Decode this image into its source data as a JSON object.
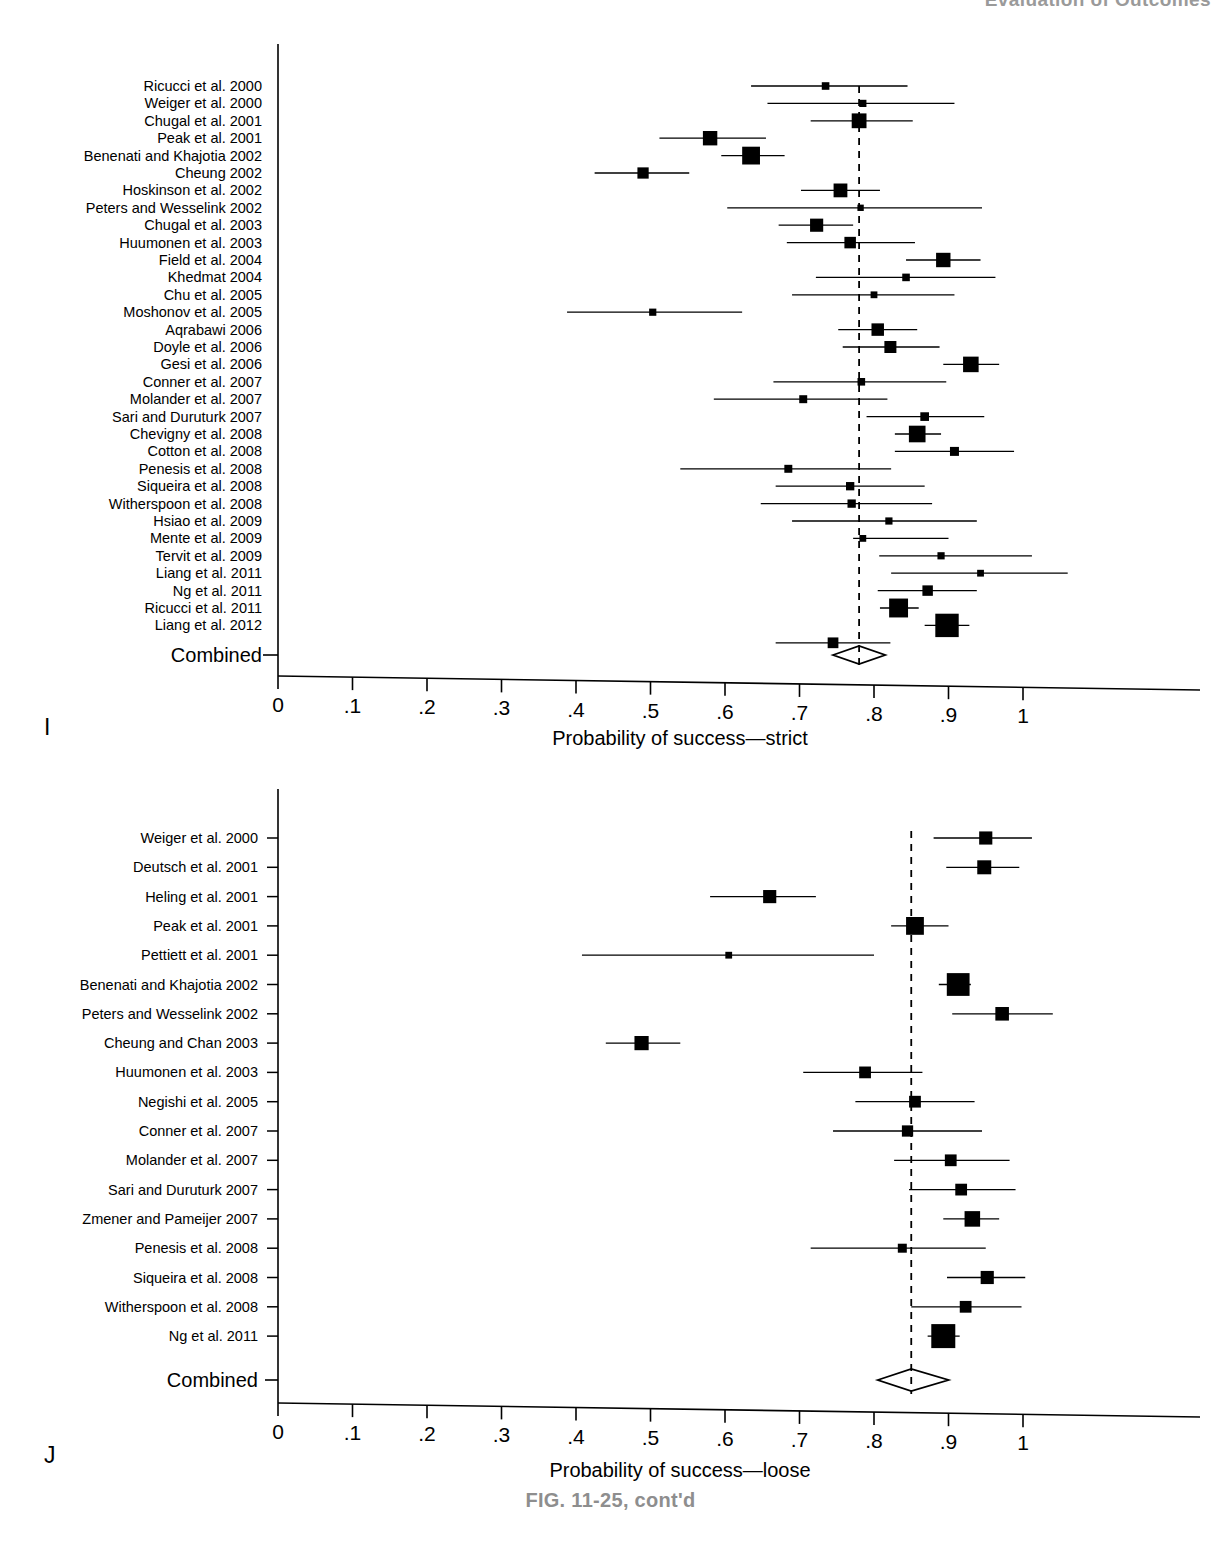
{
  "running_header": "Evaluation of Outcomes",
  "figure_caption": "FIG. 11-25, cont'd",
  "panels": [
    {
      "letter": "I",
      "axis_title": "Probability of success—strict",
      "combined_label": "Combined",
      "tick_labels": [
        "0",
        ".1",
        ".2",
        ".3",
        ".4",
        ".5",
        ".6",
        ".7",
        ".8",
        ".9",
        "1"
      ]
    },
    {
      "letter": "J",
      "axis_title": "Probability of success—loose",
      "combined_label": "Combined",
      "tick_labels": [
        "0",
        ".1",
        ".2",
        ".3",
        ".4",
        ".5",
        ".6",
        ".7",
        ".8",
        ".9",
        "1"
      ]
    }
  ],
  "chart_data": [
    {
      "type": "forest",
      "panel": "I",
      "title": "",
      "xlabel": "Probability of success—strict",
      "ylabel": "",
      "xlim": [
        0,
        1
      ],
      "xticks": [
        0,
        0.1,
        0.2,
        0.3,
        0.4,
        0.5,
        0.6,
        0.7,
        0.8,
        0.9,
        1
      ],
      "xtick_labels": [
        "0",
        ".1",
        ".2",
        ".3",
        ".4",
        ".5",
        ".6",
        ".7",
        ".8",
        ".9",
        "1"
      ],
      "grid": false,
      "reference_line": 0.78,
      "reference_line_style": "dashed",
      "summary": {
        "label": "Combined",
        "estimate": 0.78,
        "ci_low": 0.745,
        "ci_high": 0.815,
        "marker": "diamond"
      },
      "studies": [
        {
          "label": "Ricucci et al. 2000",
          "estimate": 0.735,
          "ci_low": 0.635,
          "ci_high": 0.845,
          "weight": 0.1
        },
        {
          "label": "Weiger et al. 2000",
          "estimate": 0.785,
          "ci_low": 0.657,
          "ci_high": 0.908,
          "weight": 0.09
        },
        {
          "label": "Chugal et al. 2001",
          "estimate": 0.78,
          "ci_low": 0.715,
          "ci_high": 0.852,
          "weight": 0.38
        },
        {
          "label": "Peak et al. 2001",
          "estimate": 0.58,
          "ci_low": 0.512,
          "ci_high": 0.655,
          "weight": 0.36
        },
        {
          "label": "Benenati and Khajotia 2002",
          "estimate": 0.635,
          "ci_low": 0.595,
          "ci_high": 0.68,
          "weight": 0.55
        },
        {
          "label": "Cheung 2002",
          "estimate": 0.49,
          "ci_low": 0.425,
          "ci_high": 0.552,
          "weight": 0.22
        },
        {
          "label": "Hoskinson et al. 2002",
          "estimate": 0.755,
          "ci_low": 0.702,
          "ci_high": 0.808,
          "weight": 0.33
        },
        {
          "label": "Peters and Wesselink 2002",
          "estimate": 0.782,
          "ci_low": 0.603,
          "ci_high": 0.945,
          "weight": 0.07
        },
        {
          "label": "Chugal et al. 2003",
          "estimate": 0.723,
          "ci_low": 0.672,
          "ci_high": 0.772,
          "weight": 0.3
        },
        {
          "label": "Huumonen et al. 2003",
          "estimate": 0.768,
          "ci_low": 0.683,
          "ci_high": 0.855,
          "weight": 0.23
        },
        {
          "label": "Field et al. 2004",
          "estimate": 0.893,
          "ci_low": 0.843,
          "ci_high": 0.943,
          "weight": 0.36
        },
        {
          "label": "Khedmat 2004",
          "estimate": 0.843,
          "ci_low": 0.722,
          "ci_high": 0.963,
          "weight": 0.1
        },
        {
          "label": "Chu et al. 2005",
          "estimate": 0.8,
          "ci_low": 0.69,
          "ci_high": 0.908,
          "weight": 0.08
        },
        {
          "label": "Moshonov et al. 2005",
          "estimate": 0.503,
          "ci_low": 0.388,
          "ci_high": 0.623,
          "weight": 0.09
        },
        {
          "label": "Aqrabawi 2006",
          "estimate": 0.805,
          "ci_low": 0.752,
          "ci_high": 0.858,
          "weight": 0.27
        },
        {
          "label": "Doyle et al. 2006",
          "estimate": 0.822,
          "ci_low": 0.758,
          "ci_high": 0.888,
          "weight": 0.25
        },
        {
          "label": "Gesi et al. 2006",
          "estimate": 0.93,
          "ci_low": 0.893,
          "ci_high": 0.968,
          "weight": 0.42
        },
        {
          "label": "Conner et al. 2007",
          "estimate": 0.783,
          "ci_low": 0.665,
          "ci_high": 0.897,
          "weight": 0.1
        },
        {
          "label": "Molander et al. 2007",
          "estimate": 0.705,
          "ci_low": 0.585,
          "ci_high": 0.818,
          "weight": 0.11
        },
        {
          "label": "Sari and Duruturk 2007",
          "estimate": 0.868,
          "ci_low": 0.79,
          "ci_high": 0.948,
          "weight": 0.13
        },
        {
          "label": "Chevigny et al. 2008",
          "estimate": 0.858,
          "ci_low": 0.828,
          "ci_high": 0.89,
          "weight": 0.48
        },
        {
          "label": "Cotton et al. 2008",
          "estimate": 0.908,
          "ci_low": 0.828,
          "ci_high": 0.988,
          "weight": 0.14
        },
        {
          "label": "Penesis et al. 2008",
          "estimate": 0.685,
          "ci_low": 0.54,
          "ci_high": 0.823,
          "weight": 0.11
        },
        {
          "label": "Siqueira et al. 2008",
          "estimate": 0.768,
          "ci_low": 0.668,
          "ci_high": 0.868,
          "weight": 0.12
        },
        {
          "label": "Witherspoon et al. 2008",
          "estimate": 0.77,
          "ci_low": 0.648,
          "ci_high": 0.878,
          "weight": 0.12
        },
        {
          "label": "Hsiao et al. 2009",
          "estimate": 0.82,
          "ci_low": 0.69,
          "ci_high": 0.938,
          "weight": 0.09
        },
        {
          "label": "Mente et al. 2009",
          "estimate": 0.785,
          "ci_low": 0.772,
          "ci_high": 0.9,
          "weight": 0.08
        },
        {
          "label": "Tervit et al. 2009",
          "estimate": 0.89,
          "ci_low": 0.807,
          "ci_high": 1.012,
          "weight": 0.09
        },
        {
          "label": "Liang et al. 2011",
          "estimate": 0.943,
          "ci_low": 0.823,
          "ci_high": 1.06,
          "weight": 0.08
        },
        {
          "label": "Ng et al. 2011",
          "estimate": 0.872,
          "ci_low": 0.805,
          "ci_high": 0.938,
          "weight": 0.19
        },
        {
          "label": "Ricucci et al. 2011",
          "estimate": 0.833,
          "ci_low": 0.808,
          "ci_high": 0.86,
          "weight": 0.62
        },
        {
          "label": "Liang et al. 2012",
          "estimate": 0.898,
          "ci_low": 0.868,
          "ci_high": 0.928,
          "weight": 0.95
        },
        {
          "label": "",
          "estimate": 0.745,
          "ci_low": 0.668,
          "ci_high": 0.822,
          "weight": 0.2
        }
      ]
    },
    {
      "type": "forest",
      "panel": "J",
      "title": "",
      "xlabel": "Probability of success—loose",
      "ylabel": "",
      "xlim": [
        0,
        1
      ],
      "xticks": [
        0,
        0.1,
        0.2,
        0.3,
        0.4,
        0.5,
        0.6,
        0.7,
        0.8,
        0.9,
        1
      ],
      "xtick_labels": [
        "0",
        ".1",
        ".2",
        ".3",
        ".4",
        ".5",
        ".6",
        ".7",
        ".8",
        ".9",
        "1"
      ],
      "grid": false,
      "reference_line": 0.85,
      "reference_line_style": "dashed",
      "summary": {
        "label": "Combined",
        "estimate": 0.85,
        "ci_low": 0.805,
        "ci_high": 0.9,
        "marker": "diamond"
      },
      "studies": [
        {
          "label": "Weiger et al. 2000",
          "estimate": 0.95,
          "ci_low": 0.88,
          "ci_high": 1.012,
          "weight": 0.3
        },
        {
          "label": "Deutsch et al. 2001",
          "estimate": 0.948,
          "ci_low": 0.897,
          "ci_high": 0.995,
          "weight": 0.34
        },
        {
          "label": "Heling et al. 2001",
          "estimate": 0.66,
          "ci_low": 0.58,
          "ci_high": 0.722,
          "weight": 0.3
        },
        {
          "label": "Peak et al. 2001",
          "estimate": 0.855,
          "ci_low": 0.823,
          "ci_high": 0.9,
          "weight": 0.55
        },
        {
          "label": "Pettiett et al. 2001",
          "estimate": 0.605,
          "ci_low": 0.408,
          "ci_high": 0.8,
          "weight": 0.08
        },
        {
          "label": "Benenati and Khajotia 2002",
          "estimate": 0.913,
          "ci_low": 0.887,
          "ci_high": 0.93,
          "weight": 0.9
        },
        {
          "label": "Peters and Wesselink 2002",
          "estimate": 0.972,
          "ci_low": 0.905,
          "ci_high": 1.04,
          "weight": 0.32
        },
        {
          "label": "Cheung and Chan 2003",
          "estimate": 0.488,
          "ci_low": 0.44,
          "ci_high": 0.54,
          "weight": 0.35
        },
        {
          "label": "Huumonen et al. 2003",
          "estimate": 0.788,
          "ci_low": 0.705,
          "ci_high": 0.865,
          "weight": 0.24
        },
        {
          "label": "Negishi et al. 2005",
          "estimate": 0.855,
          "ci_low": 0.775,
          "ci_high": 0.935,
          "weight": 0.24
        },
        {
          "label": "Conner et al. 2007",
          "estimate": 0.845,
          "ci_low": 0.745,
          "ci_high": 0.945,
          "weight": 0.22
        },
        {
          "label": "Molander et al. 2007",
          "estimate": 0.903,
          "ci_low": 0.827,
          "ci_high": 0.982,
          "weight": 0.24
        },
        {
          "label": "Sari and Duruturk 2007",
          "estimate": 0.917,
          "ci_low": 0.847,
          "ci_high": 0.99,
          "weight": 0.24
        },
        {
          "label": "Zmener and Pameijer 2007",
          "estimate": 0.932,
          "ci_low": 0.893,
          "ci_high": 0.968,
          "weight": 0.42
        },
        {
          "label": "Penesis et al. 2008",
          "estimate": 0.838,
          "ci_low": 0.715,
          "ci_high": 0.95,
          "weight": 0.14
        },
        {
          "label": "Siqueira et al. 2008",
          "estimate": 0.952,
          "ci_low": 0.898,
          "ci_high": 1.003,
          "weight": 0.3
        },
        {
          "label": "Witherspoon et al. 2008",
          "estimate": 0.923,
          "ci_low": 0.85,
          "ci_high": 0.998,
          "weight": 0.24
        },
        {
          "label": "Ng et al. 2011",
          "estimate": 0.893,
          "ci_low": 0.872,
          "ci_high": 0.915,
          "weight": 1.0
        }
      ]
    }
  ]
}
